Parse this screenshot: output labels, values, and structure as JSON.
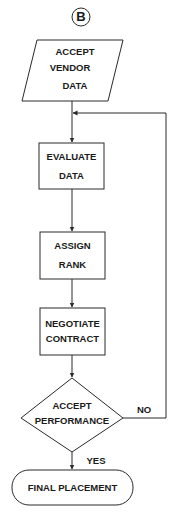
{
  "diagram": {
    "type": "flowchart",
    "connector": {
      "label": "B"
    },
    "nodes": [
      {
        "id": "accept-vendor-data",
        "shape": "parallelogram",
        "lines": [
          "ACCEPT",
          "VENDOR",
          "DATA"
        ]
      },
      {
        "id": "evaluate-data",
        "shape": "rectangle",
        "lines": [
          "EVALUATE",
          "DATA"
        ]
      },
      {
        "id": "assign-rank",
        "shape": "rectangle",
        "lines": [
          "ASSIGN",
          "RANK"
        ]
      },
      {
        "id": "negotiate-contract",
        "shape": "rectangle",
        "lines": [
          "NEGOTIATE",
          "CONTRACT"
        ]
      },
      {
        "id": "accept-performance",
        "shape": "diamond",
        "lines": [
          "ACCEPT",
          "PERFORMANCE"
        ]
      },
      {
        "id": "final-placement",
        "shape": "terminator",
        "lines": [
          "FINAL PLACEMENT"
        ]
      }
    ],
    "edges": [
      {
        "from": "B",
        "to": "accept-vendor-data"
      },
      {
        "from": "accept-vendor-data",
        "to": "evaluate-data"
      },
      {
        "from": "evaluate-data",
        "to": "assign-rank"
      },
      {
        "from": "assign-rank",
        "to": "negotiate-contract"
      },
      {
        "from": "negotiate-contract",
        "to": "accept-performance"
      },
      {
        "from": "accept-performance",
        "to": "final-placement",
        "label": "YES"
      },
      {
        "from": "accept-performance",
        "to": "evaluate-data",
        "label": "NO"
      }
    ],
    "edge_labels": {
      "yes": "YES",
      "no": "NO"
    },
    "colors": {
      "stroke": "#2a2a2a",
      "text": "#1a1a1a",
      "background": "#ffffff"
    }
  }
}
